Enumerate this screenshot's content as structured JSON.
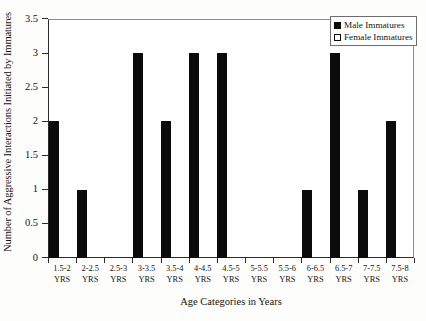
{
  "chart_data": {
    "type": "bar",
    "title": "",
    "xlabel": "Age Categories in Years",
    "ylabel": "Number of Aggressive Interactions Initiated by Immatures",
    "categories": [
      "1.5-2 YRS",
      "2-2.5 YRS",
      "2.5-3 YRS",
      "3-3.5 YRS",
      "3.5-4 YRS",
      "4-4.5 YRS",
      "4.5-5 YRS",
      "5-5.5 YRS",
      "5.5-6 YRS",
      "6-6.5 YRS",
      "6.5-7 YRS",
      "7-7.5 YRS",
      "7.5-8 YRS"
    ],
    "category_lines": [
      [
        "1.5-2",
        "YRS"
      ],
      [
        "2-2.5",
        "YRS"
      ],
      [
        "2.5-3",
        "YRS"
      ],
      [
        "3-3.5",
        "YRS"
      ],
      [
        "3.5-4",
        "YRS"
      ],
      [
        "4-4.5",
        "YRS"
      ],
      [
        "4.5-5",
        "YRS"
      ],
      [
        "5-5.5",
        "YRS"
      ],
      [
        "5.5-6",
        "YRS"
      ],
      [
        "6-6.5",
        "YRS"
      ],
      [
        "6.5-7",
        "YRS"
      ],
      [
        "7-7.5",
        "YRS"
      ],
      [
        "7.5-8",
        "YRS"
      ]
    ],
    "series": [
      {
        "name": "Male Immatures",
        "color": "#0b0b0b",
        "values": [
          2,
          1,
          0,
          3,
          2,
          3,
          3,
          0,
          0,
          1,
          3,
          1,
          2
        ]
      },
      {
        "name": "Female Immatures",
        "color": "#ffffff",
        "values": [
          0,
          0,
          0,
          0,
          0,
          0,
          0,
          0,
          0,
          0,
          0,
          0,
          0
        ]
      }
    ],
    "ylim": [
      0,
      3.5
    ],
    "ytick_labels": [
      "0",
      "0.5",
      "1",
      "1.5",
      "2",
      "2.5",
      "3",
      "3.5"
    ],
    "ytick_values": [
      0,
      0.5,
      1,
      1.5,
      2,
      2.5,
      3,
      3.5
    ],
    "grid": false,
    "legend_position": "top-right",
    "legend": [
      {
        "label": "Male Immatures",
        "swatch": "filled-square"
      },
      {
        "label": "Female Immatures",
        "swatch": "open-square"
      }
    ]
  }
}
